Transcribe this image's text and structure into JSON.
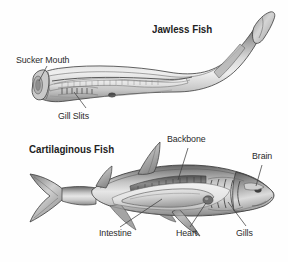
{
  "figure": {
    "background_color": "#fefefe",
    "ink_color": "#2b2b2b",
    "style": "grayscale pen-and-ink scientific illustration"
  },
  "diagrams": [
    {
      "heading": "Jawless Fish",
      "organism": "lamprey",
      "labels": [
        {
          "text": "Sucker Mouth",
          "target": "head sucker disc"
        },
        {
          "text": "Gill Slits",
          "target": "row of gill pores"
        }
      ]
    },
    {
      "heading": "Cartilaginous Fish",
      "organism": "shark",
      "labels": [
        {
          "text": "Backbone",
          "target": "vertebral column"
        },
        {
          "text": "Brain",
          "target": "cranial cavity"
        },
        {
          "text": "Intestine",
          "target": "spiral intestine"
        },
        {
          "text": "Heart",
          "target": "heart"
        },
        {
          "text": "Gills",
          "target": "gill arches"
        }
      ]
    }
  ],
  "headings": {
    "jawless": "Jawless Fish",
    "cartilaginous": "Cartilaginous Fish"
  },
  "callouts": {
    "sucker_mouth": "Sucker Mouth",
    "gill_slits": "Gill Slits",
    "backbone": "Backbone",
    "brain": "Brain",
    "intestine": "Intestine",
    "heart": "Heart",
    "gills": "Gills"
  },
  "colors": {
    "ink": "#2b2b2b",
    "leader": "#4a4a4a",
    "body_light": "#e9e9e9",
    "body_mid": "#bdbdbd",
    "body_dark": "#8a8a8a",
    "body_darkest": "#5d5d5d",
    "outline": "#3a3a3a"
  }
}
